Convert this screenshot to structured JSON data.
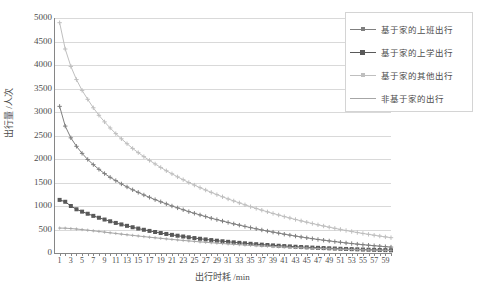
{
  "chart_data": {
    "type": "line",
    "title": "",
    "xlabel": "出行时耗 /min",
    "ylabel": "出行量 /人次",
    "xlim": [
      0,
      60
    ],
    "ylim": [
      0,
      5000
    ],
    "ytick_step": 500,
    "grid": true,
    "legend_position": "top-right",
    "x": [
      1,
      2,
      3,
      4,
      5,
      6,
      7,
      8,
      9,
      10,
      11,
      12,
      13,
      14,
      15,
      16,
      17,
      18,
      19,
      20,
      21,
      22,
      23,
      24,
      25,
      26,
      27,
      28,
      29,
      30,
      31,
      32,
      33,
      34,
      35,
      36,
      37,
      38,
      39,
      40,
      41,
      42,
      43,
      44,
      45,
      46,
      47,
      48,
      49,
      50,
      51,
      52,
      53,
      54,
      55,
      56,
      57,
      58,
      59,
      60
    ],
    "xticks": [
      1,
      3,
      5,
      7,
      9,
      11,
      13,
      15,
      17,
      19,
      21,
      23,
      25,
      27,
      29,
      31,
      33,
      35,
      37,
      39,
      41,
      43,
      45,
      47,
      49,
      51,
      53,
      55,
      57,
      59
    ],
    "yticks": [
      0,
      500,
      1000,
      1500,
      2000,
      2500,
      3000,
      3500,
      4000,
      4500,
      5000
    ],
    "series": [
      {
        "name": "基于家的上班出行",
        "color": "#7f7f7f",
        "marker": "cross",
        "values": [
          3120,
          2700,
          2450,
          2270,
          2120,
          1990,
          1880,
          1780,
          1690,
          1610,
          1540,
          1470,
          1405,
          1345,
          1290,
          1235,
          1185,
          1135,
          1090,
          1045,
          1000,
          960,
          920,
          880,
          845,
          810,
          775,
          740,
          710,
          680,
          650,
          620,
          593,
          566,
          540,
          515,
          490,
          467,
          444,
          422,
          400,
          380,
          360,
          341,
          323,
          305,
          288,
          272,
          257,
          242,
          228,
          214,
          201,
          189,
          177,
          166,
          155,
          145,
          135,
          126
        ]
      },
      {
        "name": "基于家的上学出行",
        "color": "#595959",
        "marker": "square",
        "values": [
          1130,
          1090,
          1000,
          930,
          880,
          835,
          790,
          750,
          712,
          675,
          640,
          608,
          578,
          548,
          520,
          494,
          470,
          447,
          425,
          405,
          386,
          368,
          351,
          334,
          318,
          303,
          289,
          275,
          262,
          250,
          238,
          227,
          216,
          206,
          196,
          187,
          178,
          170,
          162,
          154,
          147,
          140,
          133,
          127,
          121,
          115,
          110,
          105,
          100,
          95,
          90,
          86,
          82,
          78,
          74,
          70,
          67,
          64,
          61,
          58
        ]
      },
      {
        "name": "基于家的其他出行",
        "color": "#bfbfbf",
        "marker": "cross",
        "values": [
          4900,
          4340,
          3970,
          3690,
          3460,
          3270,
          3090,
          2930,
          2790,
          2660,
          2540,
          2430,
          2325,
          2225,
          2135,
          2050,
          1970,
          1895,
          1820,
          1750,
          1685,
          1620,
          1560,
          1500,
          1445,
          1390,
          1340,
          1290,
          1242,
          1196,
          1150,
          1108,
          1066,
          1025,
          986,
          948,
          911,
          876,
          841,
          808,
          775,
          744,
          713,
          684,
          655,
          627,
          600,
          574,
          549,
          525,
          502,
          479,
          457,
          436,
          416,
          397,
          378,
          360,
          343,
          326
        ]
      },
      {
        "name": "非基于家的出行",
        "color": "#a6a6a6",
        "marker": "cross-small",
        "values": [
          530,
          528,
          520,
          510,
          498,
          485,
          472,
          458,
          444,
          430,
          416,
          402,
          388,
          375,
          362,
          349,
          336,
          324,
          312,
          300,
          289,
          278,
          267,
          257,
          247,
          237,
          228,
          219,
          210,
          201,
          193,
          185,
          177,
          170,
          163,
          156,
          149,
          143,
          137,
          131,
          125,
          120,
          115,
          110,
          105,
          100,
          96,
          92,
          88,
          84,
          80,
          77,
          73,
          70,
          67,
          64,
          61,
          58,
          56,
          53
        ]
      }
    ]
  }
}
